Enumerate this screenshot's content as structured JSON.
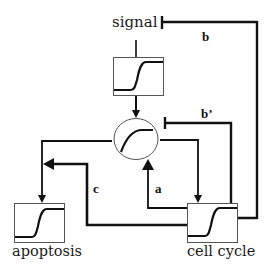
{
  "diagram": {
    "nodes": {
      "signal": {
        "label": "signal",
        "shape": "box-sigmoid"
      },
      "integrator": {
        "label": "",
        "shape": "ellipse-saturating-curve"
      },
      "apoptosis": {
        "label": "apoptosis",
        "shape": "box-sigmoid"
      },
      "cell_cycle": {
        "label": "cell cycle",
        "shape": "box-sigmoid"
      }
    },
    "edges": [
      {
        "id": "signal-to-integrator",
        "from": "signal",
        "to": "integrator",
        "type": "activation",
        "label": ""
      },
      {
        "id": "integrator-to-apoptosis",
        "from": "integrator",
        "to": "apoptosis",
        "type": "activation",
        "label": ""
      },
      {
        "id": "integrator-to-cell-cycle",
        "from": "integrator",
        "to": "cell_cycle",
        "type": "activation",
        "label": ""
      },
      {
        "id": "a",
        "from": "cell_cycle",
        "to": "integrator",
        "type": "activation",
        "label": "a"
      },
      {
        "id": "b",
        "from": "cell_cycle",
        "to": "signal",
        "type": "inhibition",
        "label": "b"
      },
      {
        "id": "b-prime",
        "from": "cell_cycle",
        "to": "integrator",
        "type": "inhibition",
        "label": "b’"
      },
      {
        "id": "c",
        "from": "cell_cycle",
        "to": "apoptosis",
        "type": "activation",
        "label": "c"
      }
    ],
    "colors": {
      "line": "#111111",
      "box_border": "#555555",
      "background": "#ffffff"
    }
  }
}
